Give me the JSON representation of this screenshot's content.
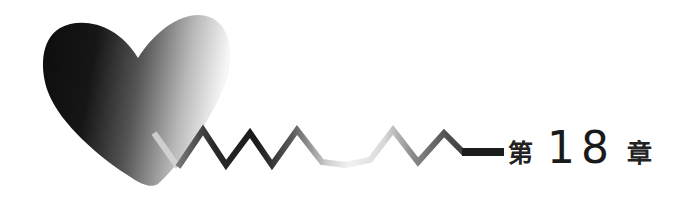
{
  "chapter_heading": {
    "prefix": "第",
    "number": "18",
    "suffix": "章"
  },
  "ornament": {
    "heart_icon": "heart-icon",
    "heartbeat_icon": "heartbeat-line-icon",
    "colors": {
      "heart_dark": "#0d0d0d",
      "heart_mid": "#6e6e6e",
      "heart_light": "#f4f4f4",
      "line_dark": "#1c1c1c",
      "line_mid": "#777777",
      "line_light": "#e6e6e6",
      "highlight": "#d8d8d8"
    }
  }
}
